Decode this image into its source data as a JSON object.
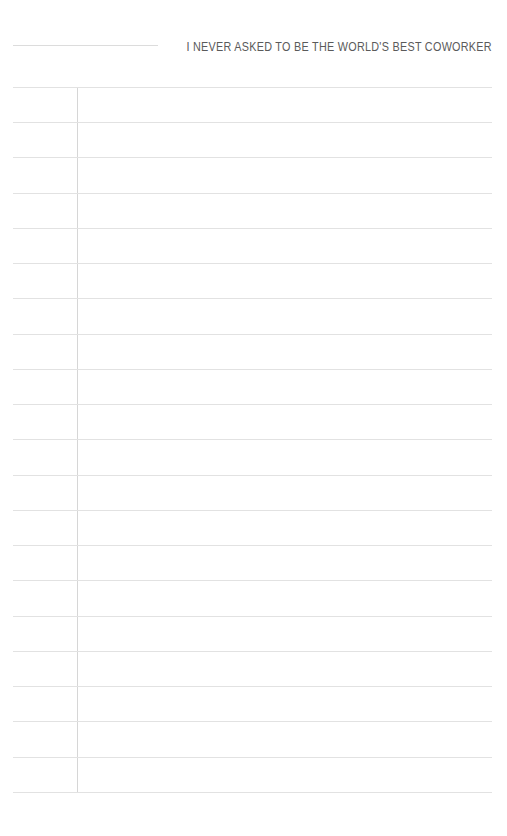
{
  "page": {
    "kind": "ruled-notebook-page",
    "width": 507,
    "height": 836,
    "background_color": "#ffffff"
  },
  "header": {
    "slogan": "I NEVER ASKED TO BE THE WORLD'S BEST COWORKER",
    "slogan_color": "#5a5a5a",
    "writein_rule": {
      "label": "",
      "left": 13,
      "top": 45,
      "width": 145,
      "color": "#dcdcdc"
    }
  },
  "ruling": {
    "line_color": "#e2e2e2",
    "margin_line_color": "#d6d6d6",
    "line_left": 13,
    "line_right": 492,
    "line_width": 479,
    "first_line_y": 87,
    "last_line_y": 792,
    "line_spacing": 35.25,
    "line_count": 21,
    "margin_line_x": 77,
    "margin_line_top": 87,
    "margin_line_bottom": 792,
    "line_y_positions": [
      87,
      122,
      157,
      193,
      228,
      263,
      298,
      334,
      369,
      404,
      439,
      475,
      510,
      545,
      580,
      616,
      651,
      686,
      721,
      757,
      792
    ]
  },
  "content": {
    "body_text": "",
    "is_blank": true
  }
}
